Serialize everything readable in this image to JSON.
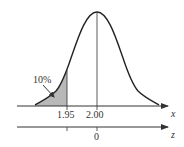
{
  "diagram": {
    "type": "normal-distribution",
    "mean_x": "2.00",
    "mean_z": "0",
    "cutoff_x": "1.95",
    "shaded_area_label": "10%",
    "x_axis_label": "x",
    "z_axis_label": "z",
    "colors": {
      "curve": "#222222",
      "shade": "#b8b8b8",
      "axis": "#333333"
    }
  }
}
